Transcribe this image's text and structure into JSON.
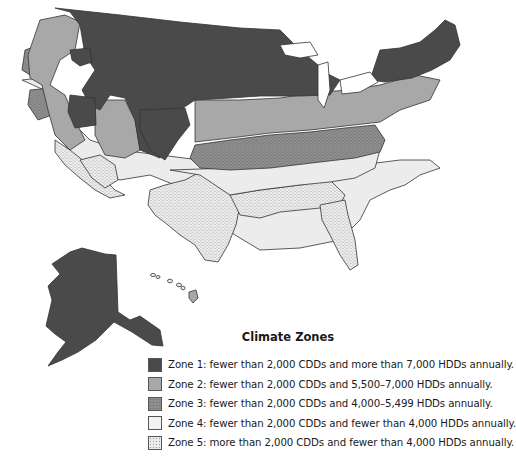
{
  "map": {
    "subject": "Contiguous United States, Alaska and Hawaii climate zones",
    "colors": {
      "zone1": "#4a4a4a",
      "zone2": "#a8a8a8",
      "zone3": "#8e8e8e",
      "zone4": "#ececec",
      "zone5": "#e2e2e2",
      "border": "#333333"
    }
  },
  "legend": {
    "title": "Climate Zones",
    "items": [
      {
        "zone": 1,
        "label": "Zone 1: fewer than 2,000 CDDs and more than 7,000 HDDs annually.",
        "swatch": "solid-dark"
      },
      {
        "zone": 2,
        "label": "Zone 2: fewer than 2,000 CDDs and 5,500–7,000 HDDs annually.",
        "swatch": "solid-medium"
      },
      {
        "zone": 3,
        "label": "Zone 3: fewer than 2,000 CDDs and 4,000–5,499 HDDs annually.",
        "swatch": "dotted-medium"
      },
      {
        "zone": 4,
        "label": "Zone 4: fewer than 2,000 CDDs and fewer than 4,000 HDDs annually.",
        "swatch": "solid-light"
      },
      {
        "zone": 5,
        "label": "Zone 5: more than 2,000 CDDs and fewer than 4,000 HDDs annually.",
        "swatch": "dotted-light"
      }
    ]
  }
}
